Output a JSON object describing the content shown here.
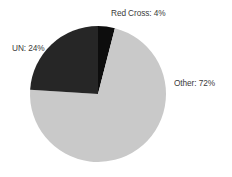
{
  "chart_data": {
    "type": "pie",
    "title": "",
    "subtitle": "",
    "xlabel": "",
    "ylabel": "",
    "grid": false,
    "legend": "none",
    "labels_position": "outside",
    "start_angle_deg": 0,
    "direction": "clockwise",
    "units": "percent",
    "categories": [
      "Red Cross",
      "Other",
      "UN"
    ],
    "values": [
      4,
      72,
      24
    ],
    "slices": [
      {
        "name": "Red Cross",
        "value": 4,
        "label": "Red Cross: 4%",
        "color": "#0d0d0d",
        "start_angle_deg": 0,
        "end_angle_deg": 14.4
      },
      {
        "name": "Other",
        "value": 72,
        "label": "Other: 72%",
        "color": "#c9c9c9",
        "start_angle_deg": 14.4,
        "end_angle_deg": 273.6
      },
      {
        "name": "UN",
        "value": 24,
        "label": "UN: 24%",
        "color": "#262626",
        "start_angle_deg": 273.6,
        "end_angle_deg": 360
      }
    ],
    "geometry": {
      "center_x": 98,
      "center_y": 94,
      "radius": 68
    },
    "colors": {
      "background": "#ffffff",
      "label_text": "#3b3b3b",
      "red_cross": "#0d0d0d",
      "other": "#c9c9c9",
      "un": "#262626"
    }
  }
}
